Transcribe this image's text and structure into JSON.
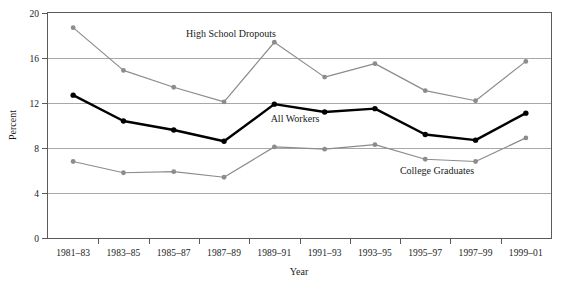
{
  "chart_data": {
    "type": "line",
    "title": "",
    "xlabel": "Year",
    "ylabel": "Percent",
    "categories": [
      "1981–83",
      "1983–85",
      "1985–87",
      "1987–89",
      "1989–91",
      "1991–93",
      "1993–95",
      "1995–97",
      "1997–99",
      "1999–01"
    ],
    "ylim": [
      0,
      20
    ],
    "yticks": [
      0,
      4,
      8,
      12,
      16,
      20
    ],
    "ytick_labels": [
      "0",
      "4",
      "8",
      "12",
      "16",
      "20"
    ],
    "grid": "horizontal",
    "legend": "inline-annotations",
    "series": [
      {
        "name": "High School Dropouts",
        "color": "#8c8c8c",
        "style": "thin-gray",
        "values": [
          18.7,
          14.9,
          13.4,
          12.1,
          17.4,
          14.3,
          15.5,
          13.1,
          12.2,
          15.7
        ]
      },
      {
        "name": "All Workers",
        "color": "#000000",
        "style": "thick-black",
        "values": [
          12.7,
          10.4,
          9.6,
          8.6,
          11.9,
          11.2,
          11.5,
          9.2,
          8.7,
          11.1
        ]
      },
      {
        "name": "College Graduates",
        "color": "#8c8c8c",
        "style": "thin-gray",
        "values": [
          6.8,
          5.8,
          5.9,
          5.4,
          8.1,
          7.9,
          8.3,
          7.0,
          6.8,
          8.9
        ]
      }
    ],
    "annotations": [
      {
        "text": "High School Dropouts",
        "x_px": 231,
        "y_px": 37
      },
      {
        "text": "All Workers",
        "x_px": 295,
        "y_px": 122
      },
      {
        "text": "College Graduates",
        "x_px": 437,
        "y_px": 174
      }
    ]
  },
  "axis": {
    "y_title": "Percent",
    "x_title": "Year"
  }
}
